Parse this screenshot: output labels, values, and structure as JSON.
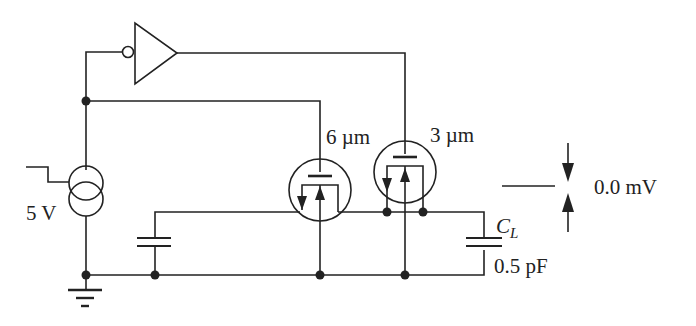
{
  "diagram": {
    "type": "circuit-schematic",
    "source": {
      "label": "5 V",
      "step_icon": "falling-step"
    },
    "transistor_left": {
      "label": "6 µm"
    },
    "transistor_right": {
      "label": "3 µm"
    },
    "load_cap": {
      "name": "C",
      "subscript": "L",
      "value": "0.5 pF"
    },
    "readout": {
      "value": "0.0 mV"
    },
    "colors": {
      "stroke": "#222222",
      "background": "#ffffff"
    }
  }
}
